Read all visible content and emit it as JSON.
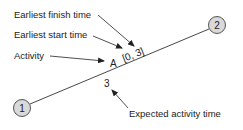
{
  "diagram": {
    "nodes": [
      {
        "id": "1",
        "label": "1",
        "cx": 22,
        "cy": 108,
        "fill": "#d9d9d9"
      },
      {
        "id": "2",
        "label": "2",
        "cx": 217,
        "cy": 25,
        "fill": "#d9d9d9"
      }
    ],
    "edge": {
      "from": "1",
      "to": "2"
    },
    "activity_label": "A",
    "time_bracket": "[0, 3]",
    "expected_time": "3",
    "annotations": {
      "earliest_finish": "Earliest finish time",
      "earliest_start": "Earliest start time",
      "activity": "Activity",
      "expected_activity_time": "Expected activity time"
    }
  }
}
